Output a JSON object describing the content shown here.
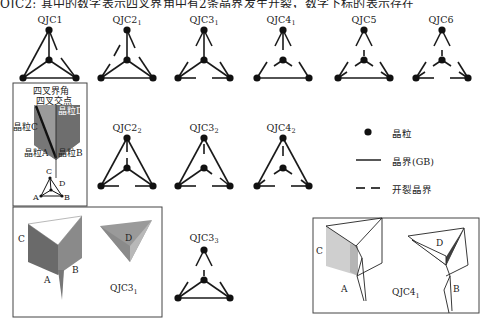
{
  "header": {
    "text": "QJC2; 其中的数字表示四叉界角中有2条晶界发生开裂，数字下标的表示存在"
  },
  "diagrams": {
    "row1": [
      {
        "id": "QJC1",
        "base": "QJC1",
        "sub": ""
      },
      {
        "id": "QJC2_1",
        "base": "QJC2",
        "sub": "1"
      },
      {
        "id": "QJC3_1",
        "base": "QJC3",
        "sub": "1"
      },
      {
        "id": "QJC4_1",
        "base": "QJC4",
        "sub": "1"
      },
      {
        "id": "QJC5",
        "base": "QJC5",
        "sub": ""
      },
      {
        "id": "QJC6",
        "base": "QJC6",
        "sub": ""
      }
    ],
    "row2": [
      {
        "id": "QJC2_2",
        "base": "QJC2",
        "sub": "2"
      },
      {
        "id": "QJC3_2",
        "base": "QJC3",
        "sub": "2"
      },
      {
        "id": "QJC4_2",
        "base": "QJC4",
        "sub": "2"
      }
    ],
    "row3": [
      {
        "id": "QJC3_3",
        "base": "QJC3",
        "sub": "3"
      }
    ]
  },
  "schematic": {
    "title_line1": "四叉界角",
    "title_line2": "四叉交点",
    "grain_a": "晶粒A",
    "grain_b": "晶粒B",
    "grain_c": "晶粒C",
    "grain_d": "晶粒D",
    "mini": {
      "a": "A",
      "b": "B",
      "c": "C",
      "d": "D"
    }
  },
  "legend": {
    "grain": "晶粒",
    "gb": "晶界(GB)",
    "cracked": "开裂晶界"
  },
  "example_qjc3": {
    "label_base": "QJC3",
    "label_sub": "1",
    "a": "A",
    "b": "B",
    "c": "C",
    "d": "D"
  },
  "example_qjc4": {
    "label_base": "QJC4",
    "label_sub": "1",
    "a": "A",
    "b": "B",
    "c": "C",
    "d": "D"
  },
  "colors": {
    "line": "#1a1a1a",
    "grain_dark": "#6e6e6e",
    "grain_mid": "#8a8a8a",
    "grain_light": "#b5b5b5",
    "grain_lighter": "#cfcfcf",
    "box_border": "#444444"
  }
}
